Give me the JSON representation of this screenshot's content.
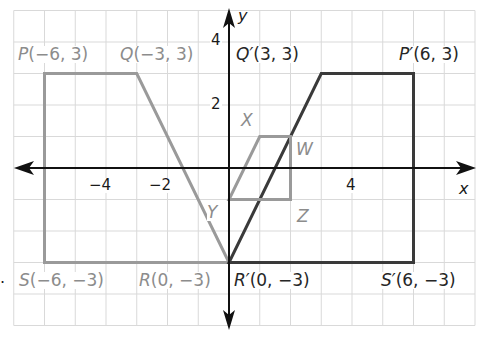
{
  "chart_data": {
    "type": "coordinate-plane-diagram",
    "title": "",
    "xlabel": "x",
    "ylabel": "y",
    "x_ticks": [
      -4,
      -2,
      4
    ],
    "y_ticks": [
      4,
      2
    ],
    "grid": true,
    "grid_range": {
      "x": [
        -7,
        8
      ],
      "y": [
        -5,
        5
      ]
    },
    "figures": [
      {
        "name": "PQRS",
        "color": "#9a9a9a",
        "vertices": [
          {
            "name": "P",
            "label": "P(−6, 3)",
            "x": -6,
            "y": 3
          },
          {
            "name": "Q",
            "label": "Q(−3, 3)",
            "x": -3,
            "y": 3
          },
          {
            "name": "R",
            "label": "R(0, −3)",
            "x": 0,
            "y": -3
          },
          {
            "name": "S",
            "label": "S(−6, −3)",
            "x": -6,
            "y": -3
          }
        ]
      },
      {
        "name": "P'Q'R'S'",
        "color": "#3a3a3a",
        "vertices": [
          {
            "name": "P'",
            "label": "P′(6, 3)",
            "x": 6,
            "y": 3
          },
          {
            "name": "Q'",
            "label": "Q′(3, 3)",
            "x": 3,
            "y": 3
          },
          {
            "name": "R'",
            "label": "R′(0, −3)",
            "x": 0,
            "y": -3
          },
          {
            "name": "S'",
            "label": "S′(6, −3)",
            "x": 6,
            "y": -3
          }
        ]
      },
      {
        "name": "XWZY",
        "color": "#9a9a9a",
        "vertices": [
          {
            "name": "X",
            "label": "X",
            "x": 1,
            "y": 1
          },
          {
            "name": "W",
            "label": "W",
            "x": 2,
            "y": 1
          },
          {
            "name": "Z",
            "label": "Z",
            "x": 2,
            "y": -1
          },
          {
            "name": "Y",
            "label": "Y",
            "x": 0,
            "y": -1
          }
        ]
      }
    ]
  },
  "labels": {
    "P": {
      "name": "P",
      "coords": "(−6, 3)"
    },
    "Q": {
      "name": "Q",
      "coords": "(−3, 3)"
    },
    "R": {
      "name": "R",
      "coords": "(0, −3)"
    },
    "S": {
      "name": "S",
      "coords": "(−6, −3)"
    },
    "Pp": {
      "name": "P′",
      "coords": "(6, 3)"
    },
    "Qp": {
      "name": "Q′",
      "coords": "(3, 3)"
    },
    "Rp": {
      "name": "R′",
      "coords": "(0, −3)"
    },
    "Sp": {
      "name": "S′",
      "coords": "(6, −3)"
    },
    "X": "X",
    "W": "W",
    "Y": "Y",
    "Z": "Z"
  },
  "axes": {
    "x_name": "x",
    "y_name": "y",
    "ticks": {
      "xm4": "−4",
      "xm2": "−2",
      "x4": "4",
      "y4": "4",
      "y2": "2"
    }
  },
  "bullet": "."
}
